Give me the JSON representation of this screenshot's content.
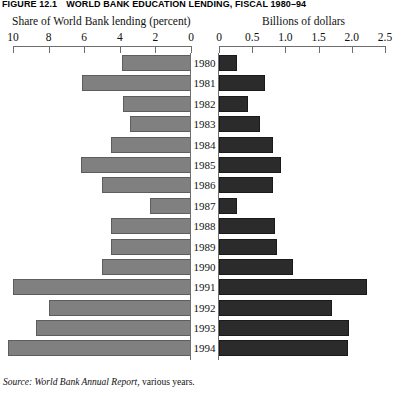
{
  "figure": {
    "number": "FIGURE 12.1",
    "title": "WORLD BANK EDUCATION LENDING, FISCAL 1980–94"
  },
  "panels": {
    "left_header": "Share of World Bank lending (percent)",
    "right_header": "Billions of dollars"
  },
  "source": {
    "lead": "Source:",
    "title": "World Bank Annual Report",
    "rest": ", various years."
  },
  "colors": {
    "left_bar": "#808080",
    "left_bar_edge": "#5d5d5d",
    "right_bar": "#2b2b2b",
    "right_bar_edge": "#1a1a1a",
    "axis": "#6e6e6e",
    "background": "#ffffff",
    "text": "#111111"
  },
  "chart_data": {
    "type": "bar",
    "title": "WORLD BANK EDUCATION LENDING, FISCAL 1980–94",
    "subtitle": "",
    "orientation": "horizontal",
    "layout": "butterfly-population-pyramid (two mirrored horizontal bar panels sharing a centered year axis)",
    "grid": false,
    "legend": "none",
    "categories": [
      "1980",
      "1981",
      "1982",
      "1983",
      "1984",
      "1985",
      "1986",
      "1987",
      "1988",
      "1989",
      "1990",
      "1991",
      "1992",
      "1993",
      "1994"
    ],
    "panels": [
      {
        "name": "left",
        "title": "Share of World Bank lending (percent)",
        "xlabel": "Share of World Bank lending (percent)",
        "ylabel": "",
        "direction": "right-to-left",
        "xlim": [
          0,
          10
        ],
        "axis_reversed": true,
        "ticks": [
          10,
          8,
          6,
          4,
          2,
          0
        ],
        "tick_labels": [
          "10",
          "8",
          "6",
          "4",
          "2",
          "0"
        ],
        "unit": "percent",
        "values": [
          3.9,
          6.1,
          3.8,
          3.4,
          4.5,
          6.2,
          5.0,
          2.3,
          4.5,
          4.5,
          5.0,
          10.0,
          8.0,
          8.7,
          10.3
        ]
      },
      {
        "name": "right",
        "title": "Billions of dollars",
        "xlabel": "Billions of dollars",
        "ylabel": "",
        "direction": "left-to-right",
        "xlim": [
          0,
          2.5
        ],
        "axis_reversed": false,
        "ticks": [
          0,
          0.5,
          1.0,
          1.5,
          2.0,
          2.5
        ],
        "tick_labels": [
          "0",
          "0.5",
          "1.0",
          "1.5",
          "2.0",
          "2.5"
        ],
        "unit": "billions of dollars",
        "values": [
          0.27,
          0.7,
          0.44,
          0.61,
          0.81,
          0.93,
          0.82,
          0.27,
          0.85,
          0.87,
          1.12,
          2.23,
          1.7,
          1.96,
          1.95
        ]
      }
    ]
  }
}
